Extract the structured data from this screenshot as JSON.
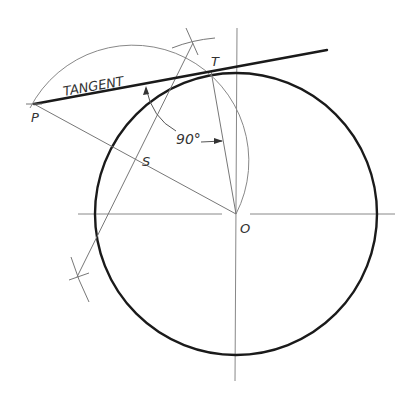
{
  "diagram": {
    "type": "geometric-construction",
    "labels": {
      "tangent": "TANGENT",
      "point_p": "P",
      "point_t": "T",
      "point_s": "S",
      "point_o": "O",
      "angle": "90°"
    },
    "points": {
      "P": [
        34,
        104
      ],
      "T": [
        211,
        71
      ],
      "S": [
        136,
        160
      ],
      "O": [
        236,
        214
      ]
    },
    "circle": {
      "center": [
        236,
        214
      ],
      "radius": 141
    },
    "construction_circle": {
      "center": [
        136,
        160
      ],
      "radius": 115
    },
    "colors": {
      "heavy_line": "#1a1a1a",
      "thin_line": "#777777",
      "text": "#333333",
      "background": "#ffffff"
    }
  }
}
